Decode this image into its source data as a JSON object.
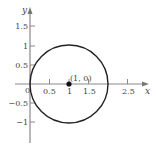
{
  "diagram": {
    "type": "circle-plot",
    "x_axis": {
      "label": "x",
      "ticks": [
        {
          "value": 0.5,
          "label": "0.5"
        },
        {
          "value": 1,
          "label": "1"
        },
        {
          "value": 1.5,
          "label": "1.5"
        },
        {
          "value": 2.5,
          "label": "2.5"
        }
      ]
    },
    "y_axis": {
      "label": "y",
      "ticks": [
        {
          "value": 1.5,
          "label": "1.5"
        },
        {
          "value": 1,
          "label": "1"
        },
        {
          "value": 0.5,
          "label": "0.5"
        },
        {
          "value": -0.5,
          "label": "−0.5"
        },
        {
          "value": -1,
          "label": "−1"
        }
      ]
    },
    "origin_label": "0",
    "circle": {
      "center": [
        1,
        0
      ],
      "radius": 1
    },
    "point": {
      "coords": [
        1,
        0
      ],
      "label": "(1, 0)"
    },
    "colors": {
      "axis": "#888888",
      "curve": "#222222",
      "text": "#444444"
    }
  }
}
